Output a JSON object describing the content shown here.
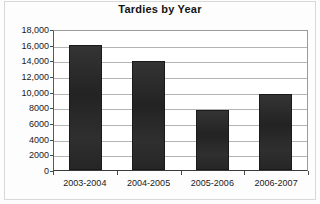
{
  "chart_data": {
    "type": "bar",
    "title": "Tardies by Year",
    "xlabel": "",
    "ylabel": "",
    "categories": [
      "2003-2004",
      "2004-2005",
      "2005-2006",
      "2006-2007"
    ],
    "values": [
      16000,
      13900,
      7700,
      9700
    ],
    "series": [
      {
        "name": "Tardies",
        "values": [
          16000,
          13900,
          7700,
          9700
        ]
      }
    ],
    "ylim": [
      0,
      18000
    ],
    "y_tick_step": 2000,
    "y_tick_labels": [
      "18,000",
      "16,000",
      "14,000",
      "12,000",
      "10,000",
      "8000",
      "6000",
      "4000",
      "2000",
      "0"
    ],
    "y_tick_values": [
      18000,
      16000,
      14000,
      12000,
      10000,
      8000,
      6000,
      4000,
      2000,
      0
    ],
    "grid": true,
    "legend": false,
    "legend_position": "none",
    "bar_color": "#2b2b2b",
    "gridline_color": "#b4b4b4",
    "axis_color": "#3a3a3a",
    "plot_background": "#ffffff"
  }
}
